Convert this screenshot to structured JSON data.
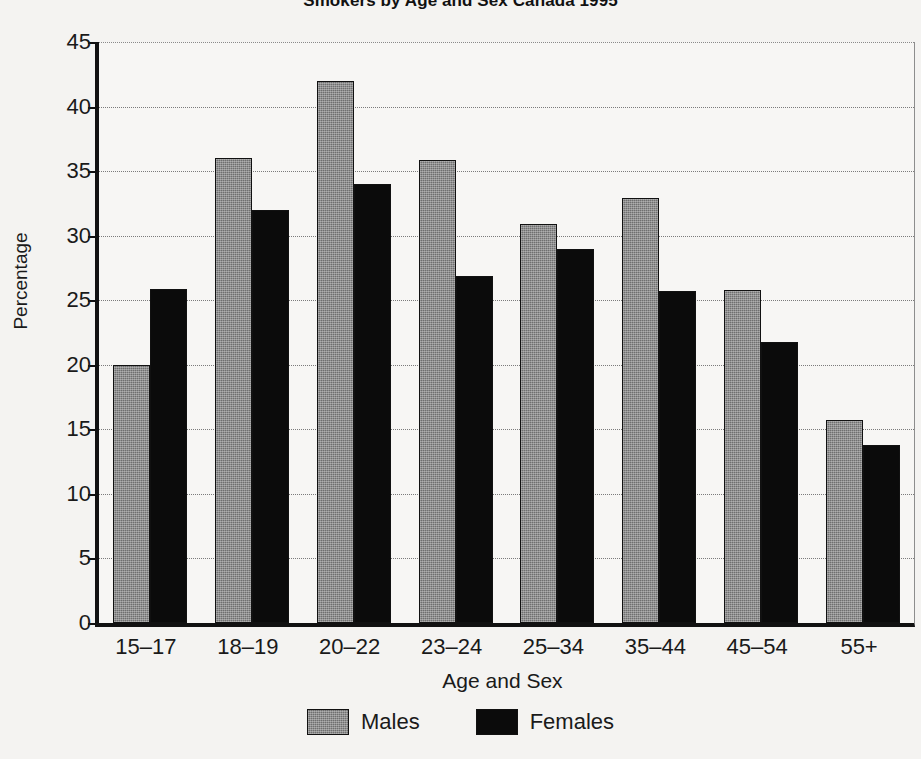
{
  "chart_data": {
    "type": "bar",
    "title": "Smokers by Age and Sex Canada 1995",
    "xlabel": "Age and Sex",
    "ylabel": "Percentage",
    "categories": [
      "15–17",
      "18–19",
      "20–22",
      "23–24",
      "25–34",
      "35–44",
      "45–54",
      "55+"
    ],
    "series": [
      {
        "name": "Males",
        "color": "#6f6f6f",
        "values": [
          20.0,
          36.0,
          42.0,
          35.9,
          30.9,
          32.9,
          25.8,
          15.7
        ]
      },
      {
        "name": "Females",
        "color": "#0b0b0b",
        "values": [
          25.9,
          32.0,
          34.0,
          26.9,
          29.0,
          25.7,
          21.8,
          13.8
        ]
      }
    ],
    "ylim": [
      0,
      45
    ],
    "yticks": [
      0,
      5,
      10,
      15,
      20,
      25,
      30,
      35,
      40,
      45
    ],
    "ytick_labels": [
      "0",
      "5",
      "10",
      "15",
      "20",
      "25",
      "30",
      "35",
      "40",
      "45"
    ],
    "grid": true,
    "legend_position": "bottom"
  }
}
